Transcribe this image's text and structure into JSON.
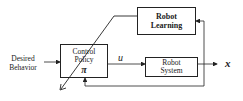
{
  "blocks": {
    "robot_learning": {
      "line1": "Robot",
      "line2": "Learning"
    },
    "control_policy": {
      "line1": "Control",
      "line2": "Policy",
      "symbol": "π"
    },
    "robot_system": {
      "line1": "Robot",
      "line2": "System"
    }
  },
  "signals": {
    "input": {
      "line1": "Desired",
      "line2": "Behavior"
    },
    "control": "u",
    "output": "x"
  },
  "colors": {
    "stroke": "#222222",
    "background": "#ffffff"
  }
}
